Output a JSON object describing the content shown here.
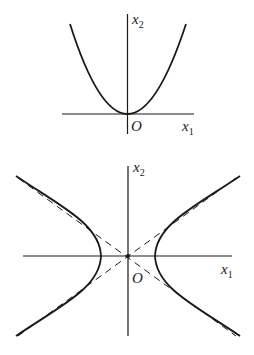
{
  "diagrams": [
    {
      "name": "parabola",
      "description": "Parabola opening upward with vertex at origin",
      "axes": {
        "x_label": "x",
        "x_sub": "1",
        "y_label": "x",
        "y_sub": "2",
        "origin_label": "O"
      }
    },
    {
      "name": "hyperbola",
      "description": "Hyperbola with two branches opening left/right and dashed asymptotes through origin",
      "axes": {
        "x_label": "x",
        "x_sub": "1",
        "y_label": "x",
        "y_sub": "2",
        "origin_label": "O"
      },
      "asymptotes_style": "dashed"
    }
  ],
  "colors": {
    "stroke": "#1a1a1a",
    "background": "#ffffff"
  }
}
